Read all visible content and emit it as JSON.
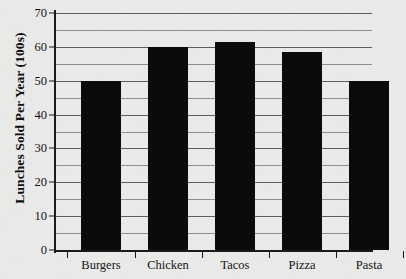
{
  "chart_data": {
    "type": "bar",
    "title": "",
    "xlabel": "",
    "ylabel": "Lunches Sold Per Year (100s)",
    "categories": [
      "Burgers",
      "Chicken",
      "Tacos",
      "Pizza",
      "Pasta"
    ],
    "values": [
      50,
      60,
      61.5,
      58.5,
      50
    ],
    "ylim": [
      0,
      70
    ],
    "y_major_ticks": [
      0,
      10,
      20,
      30,
      40,
      50,
      60,
      70
    ],
    "y_minor_gridlines": [
      5,
      15,
      25,
      35,
      45,
      55,
      65
    ],
    "y_tick_labels": [
      "0",
      "10",
      "20",
      "30",
      "40",
      "50",
      "60",
      "70"
    ],
    "grid": true,
    "legend": "none",
    "bar_color": "#0b0b0b",
    "background_color": "#e9e9e7",
    "axis_color": "#1a1a1a",
    "gridline_color": "#5d5d5d"
  }
}
